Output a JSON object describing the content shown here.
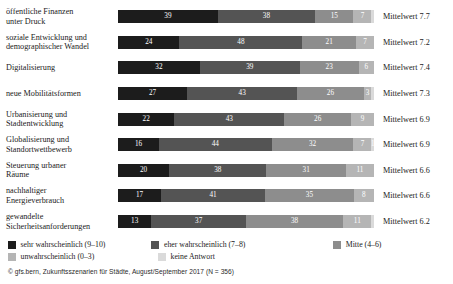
{
  "chart_data": {
    "type": "bar",
    "orientation": "horizontal",
    "stacked": true,
    "title": "",
    "xlabel": "",
    "ylabel": "",
    "xlim": [
      0,
      100
    ],
    "grid": false,
    "legend_position": "bottom-left",
    "categories": [
      "öffentliche Finanzen unter Druck",
      "soziale Entwicklung und demographischer Wandel",
      "Digitalisierung",
      "neue Mobilitätsformen",
      "Urbanisierung und Stadtentwicklung",
      "Globalisierung und Standortwettbewerb",
      "Steuerung urbaner Räume",
      "nachhaltiger Energieverbrauch",
      "gewandelte Sicherheitsanforderungen"
    ],
    "category_lines": [
      [
        "öffentliche Finanzen",
        "unter Druck"
      ],
      [
        "soziale Entwicklung und",
        "demographischer Wandel"
      ],
      [
        "Digitalisierung",
        ""
      ],
      [
        "neue Mobilitätsformen",
        ""
      ],
      [
        "Urbanisierung und",
        "Stadtentwicklung"
      ],
      [
        "Globalisierung und",
        "Standortwettbewerb"
      ],
      [
        "Steuerung urbaner",
        "Räume"
      ],
      [
        "nachhaltiger",
        "Energieverbrauch"
      ],
      [
        "gewandelte",
        "Sicherheitsanforderungen"
      ]
    ],
    "series": [
      {
        "name": "sehr wahrscheinlich (9–10)",
        "color": "#1c1c1c",
        "values": [
          39,
          24,
          32,
          27,
          22,
          16,
          20,
          17,
          13
        ]
      },
      {
        "name": "eher wahrscheinlich (7–8)",
        "color": "#545454",
        "values": [
          38,
          48,
          39,
          43,
          43,
          44,
          38,
          41,
          37
        ]
      },
      {
        "name": "Mitte (4–6)",
        "color": "#8d8d8d",
        "values": [
          15,
          21,
          23,
          26,
          26,
          32,
          31,
          35,
          38
        ]
      },
      {
        "name": "unwahrscheinlich (0–3)",
        "color": "#b5b5b5",
        "values": [
          7,
          7,
          6,
          3,
          9,
          7,
          11,
          8,
          11
        ]
      },
      {
        "name": "keine Antwort",
        "color": "#dadada",
        "values": [
          1,
          0,
          0,
          1,
          0,
          1,
          0,
          0,
          1
        ]
      }
    ],
    "value_labels": [
      [
        "39",
        "38",
        "15",
        "7",
        ""
      ],
      [
        "24",
        "48",
        "21",
        "7",
        ""
      ],
      [
        "32",
        "39",
        "23",
        "6",
        ""
      ],
      [
        "27",
        "43",
        "26",
        "3",
        ""
      ],
      [
        "22",
        "43",
        "26",
        "9",
        ""
      ],
      [
        "16",
        "44",
        "32",
        "7",
        "1"
      ],
      [
        "20",
        "38",
        "31",
        "11",
        ""
      ],
      [
        "17",
        "41",
        "35",
        "8",
        ""
      ],
      [
        "13",
        "37",
        "38",
        "11",
        ""
      ]
    ],
    "annotations": [
      "Mittelwert 7.7",
      "Mittelwert 7.2",
      "Mittelwert 7.4",
      "Mittelwert 7.3",
      "Mittelwert 6.9",
      "Mittelwert 6.9",
      "Mittelwert 6.6",
      "Mittelwert 6.6",
      "Mittelwert 6.2"
    ],
    "means": [
      7.7,
      7.2,
      7.4,
      7.3,
      6.9,
      6.9,
      6.6,
      6.6,
      6.2
    ]
  },
  "legend": {
    "row1": [
      {
        "label": "sehr wahrscheinlich (9–10)",
        "color": "#1c1c1c"
      },
      {
        "label": "eher wahrscheinlich (7–8)",
        "color": "#545454"
      },
      {
        "label": "Mitte (4–6)",
        "color": "#8d8d8d"
      }
    ],
    "row2": [
      {
        "label": "unwahrscheinlich (0–3)",
        "color": "#b5b5b5"
      },
      {
        "label": "keine Antwort",
        "color": "#dadada"
      }
    ]
  },
  "source": "© gfs.bern, Zukunftsszenarien für Städte, August/September 2017 (N = 356)"
}
